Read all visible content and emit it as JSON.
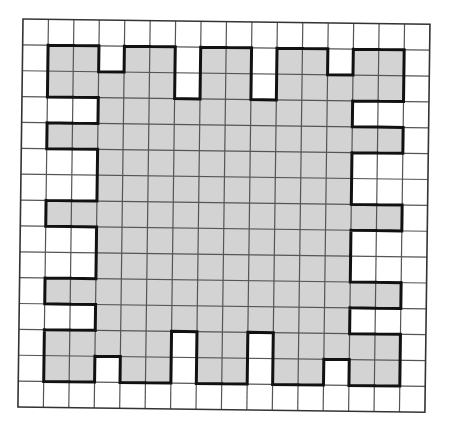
{
  "diagram": {
    "type": "grid-shading",
    "rows": 15,
    "cols": 16,
    "colors": {
      "filled": "#d3d3d3",
      "empty": "#ffffff",
      "grid_line": "#555555",
      "outline": "#111111"
    },
    "filled_cells_by_row": [
      [],
      [
        1,
        2,
        4,
        5,
        7,
        8,
        10,
        11,
        13,
        14
      ],
      [
        1,
        2,
        3,
        4,
        5,
        7,
        8,
        10,
        11,
        12,
        13,
        14
      ],
      [
        3,
        4,
        5,
        6,
        7,
        8,
        9,
        10,
        11,
        12
      ],
      [
        1,
        2,
        3,
        4,
        5,
        6,
        7,
        8,
        9,
        10,
        11,
        12,
        13,
        14
      ],
      [
        3,
        4,
        5,
        6,
        7,
        8,
        9,
        10,
        11,
        12
      ],
      [
        3,
        4,
        5,
        6,
        7,
        8,
        9,
        10,
        11,
        12
      ],
      [
        1,
        2,
        3,
        4,
        5,
        6,
        7,
        8,
        9,
        10,
        11,
        12,
        13,
        14
      ],
      [
        3,
        4,
        5,
        6,
        7,
        8,
        9,
        10,
        11,
        12
      ],
      [
        3,
        4,
        5,
        6,
        7,
        8,
        9,
        10,
        11,
        12
      ],
      [
        1,
        2,
        3,
        4,
        5,
        6,
        7,
        8,
        9,
        10,
        11,
        12,
        13,
        14
      ],
      [
        3,
        4,
        5,
        6,
        7,
        8,
        9,
        10,
        11,
        12
      ],
      [
        1,
        2,
        3,
        4,
        5,
        7,
        8,
        10,
        11,
        12,
        13,
        14
      ],
      [
        1,
        2,
        4,
        5,
        7,
        8,
        10,
        11,
        13,
        14
      ],
      []
    ]
  }
}
